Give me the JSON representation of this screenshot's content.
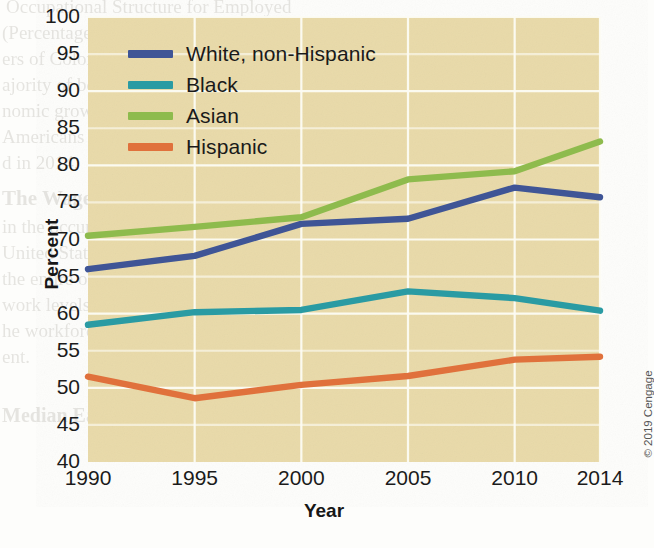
{
  "chart_data": {
    "type": "line",
    "title": "",
    "xlabel": "Year",
    "ylabel": "Percent",
    "x": [
      1990,
      1995,
      2000,
      2005,
      2010,
      2014
    ],
    "xticklabels": [
      "1990",
      "1995",
      "2000",
      "2005",
      "2010",
      "2014"
    ],
    "xlim": [
      1990,
      2014
    ],
    "ylim": [
      40,
      100
    ],
    "yticks": [
      40,
      45,
      50,
      55,
      60,
      65,
      70,
      75,
      80,
      85,
      90,
      95,
      100
    ],
    "yticklabels": [
      "40",
      "45",
      "50",
      "55",
      "60",
      "65",
      "70",
      "75",
      "80",
      "85",
      "90",
      "95",
      "100"
    ],
    "grid": "major-xy-white",
    "legend_position": "upper-left-inside",
    "plot_background": "#e9daa9",
    "series": [
      {
        "name": "White, non-Hispanic",
        "color": "#3f5596",
        "values": [
          66.0,
          67.8,
          72.1,
          72.8,
          77.0,
          75.7
        ]
      },
      {
        "name": "Black",
        "color": "#2a9ba3",
        "values": [
          58.5,
          60.2,
          60.5,
          63.0,
          62.1,
          60.4
        ]
      },
      {
        "name": "Asian",
        "color": "#8ebb4d",
        "values": [
          70.5,
          71.7,
          73.0,
          78.1,
          79.2,
          83.2
        ]
      },
      {
        "name": "Hispanic",
        "color": "#e0713c",
        "values": [
          51.5,
          48.6,
          50.4,
          51.6,
          53.8,
          54.2
        ]
      }
    ]
  },
  "copyright": "© 2019 Cengage",
  "bleed": {
    "l1": "Occupational Structure for Employed",
    "l2": "(Percentage Distribution)",
    "l3": "ers of Color and White Workers",
    "l4": "ajority of both workers",
    "l5": "nomic growth and occu",
    "l6": "Americans were enrolled in col",
    "l7": "d in 2014.",
    "l8": "The Wage Gap Anatomy",
    "l9": "in the occupational structure of",
    "l10": "United States, one fact is apparent",
    "l11": "the entire occupational structure. De",
    "l12": "work levels, discrimination and stereotypes still",
    "l13": "he workforce. Let us examine some of the com",
    "l14": "ent.",
    "l15": "",
    "l16": "Median Earnings for Workers Gathering 5 to 19",
    "l17": "",
    "l18": "",
    "l19": ""
  }
}
